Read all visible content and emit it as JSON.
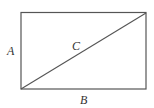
{
  "diagram": {
    "type": "rectangle-with-diagonal",
    "colors": {
      "stroke": "#555555",
      "text": "#333333",
      "background": "#ffffff"
    },
    "rectangle": {
      "x": 21,
      "y": 12,
      "width": 125,
      "height": 77
    },
    "diagonal": {
      "from": [
        21,
        89
      ],
      "to": [
        146,
        12
      ]
    },
    "labels": {
      "height": "A",
      "width": "B",
      "diagonal": "C"
    }
  }
}
